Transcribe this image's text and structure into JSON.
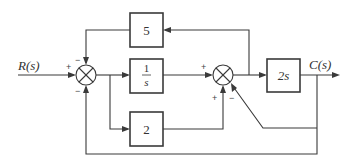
{
  "diagram": {
    "type": "control-system block diagram",
    "input_label": "R(s)",
    "output_label": "C(s)",
    "blocks": [
      {
        "id": "gain5",
        "label": "5"
      },
      {
        "id": "integrator",
        "numerator": "1",
        "denominator": "s"
      },
      {
        "id": "gain2",
        "label": "2"
      },
      {
        "id": "derivative",
        "label": "2s"
      }
    ],
    "summing_junctions": [
      {
        "id": "sum1",
        "signs": {
          "left": "+",
          "top": "−",
          "bottom": "−"
        }
      },
      {
        "id": "sum2",
        "signs": {
          "left": "+",
          "bottom_left": "+",
          "bottom_right": "−"
        }
      }
    ],
    "connections": [
      "R(s) → sum1 (+)",
      "sum1 → 1/s",
      "sum1 → 2",
      "1/s → sum2 (+)",
      "2 → sum2 (+)",
      "sum2 → 2s",
      "2s → C(s)",
      "sum2 output → 5 → sum1 (−)",
      "C(s) → sum2 (−)",
      "C(s) → sum1 (−)"
    ]
  }
}
